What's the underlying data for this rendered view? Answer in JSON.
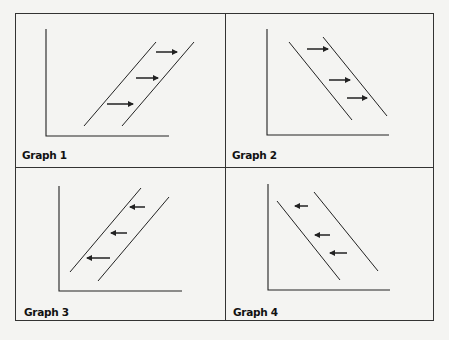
{
  "figure": {
    "background": "#f4f4f2",
    "line_color": "#222222",
    "panels": [
      {
        "label": "Graph 1",
        "curve_slope": "upward",
        "shift_direction": "right",
        "axes": {
          "x0": 46,
          "top": 29,
          "bottom": 136,
          "right": 169
        },
        "lines": [
          {
            "x1": 84,
            "y1": 126,
            "x2": 156,
            "y2": 42
          },
          {
            "x1": 122,
            "y1": 126,
            "x2": 194,
            "y2": 42
          }
        ],
        "arrows": [
          {
            "x1": 107,
            "y1": 104,
            "x2": 133,
            "y2": 104
          },
          {
            "x1": 136,
            "y1": 78,
            "x2": 158,
            "y2": 78
          },
          {
            "x1": 156,
            "y1": 52,
            "x2": 177,
            "y2": 52
          }
        ],
        "label_pos": {
          "x": 22,
          "y": 149
        }
      },
      {
        "label": "Graph 2",
        "curve_slope": "downward",
        "shift_direction": "right",
        "axes": {
          "x0": 267,
          "top": 29,
          "bottom": 135,
          "right": 389
        },
        "lines": [
          {
            "x1": 289,
            "y1": 42,
            "x2": 352,
            "y2": 120
          },
          {
            "x1": 323,
            "y1": 37,
            "x2": 387,
            "y2": 116
          }
        ],
        "arrows": [
          {
            "x1": 307,
            "y1": 49,
            "x2": 328,
            "y2": 49
          },
          {
            "x1": 329,
            "y1": 80,
            "x2": 350,
            "y2": 80
          },
          {
            "x1": 347,
            "y1": 98,
            "x2": 367,
            "y2": 98
          }
        ],
        "label_pos": {
          "x": 232,
          "y": 149
        }
      },
      {
        "label": "Graph 3",
        "curve_slope": "upward",
        "shift_direction": "left",
        "axes": {
          "x0": 59,
          "top": 186,
          "bottom": 291,
          "right": 182
        },
        "lines": [
          {
            "x1": 70,
            "y1": 272,
            "x2": 141,
            "y2": 188
          },
          {
            "x1": 98,
            "y1": 281,
            "x2": 169,
            "y2": 197
          }
        ],
        "arrows": [
          {
            "x1": 145,
            "y1": 207,
            "x2": 130,
            "y2": 207
          },
          {
            "x1": 127,
            "y1": 233,
            "x2": 111,
            "y2": 233
          },
          {
            "x1": 110,
            "y1": 258,
            "x2": 87,
            "y2": 258
          }
        ],
        "label_pos": {
          "x": 24,
          "y": 306
        }
      },
      {
        "label": "Graph 4",
        "curve_slope": "downward",
        "shift_direction": "left",
        "axes": {
          "x0": 268,
          "top": 184,
          "bottom": 290,
          "right": 390
        },
        "lines": [
          {
            "x1": 277,
            "y1": 201,
            "x2": 340,
            "y2": 280
          },
          {
            "x1": 314,
            "y1": 192,
            "x2": 378,
            "y2": 271
          }
        ],
        "arrows": [
          {
            "x1": 308,
            "y1": 206,
            "x2": 295,
            "y2": 206
          },
          {
            "x1": 330,
            "y1": 235,
            "x2": 315,
            "y2": 235
          },
          {
            "x1": 347,
            "y1": 253,
            "x2": 330,
            "y2": 253
          }
        ],
        "label_pos": {
          "x": 233,
          "y": 306
        }
      }
    ]
  }
}
